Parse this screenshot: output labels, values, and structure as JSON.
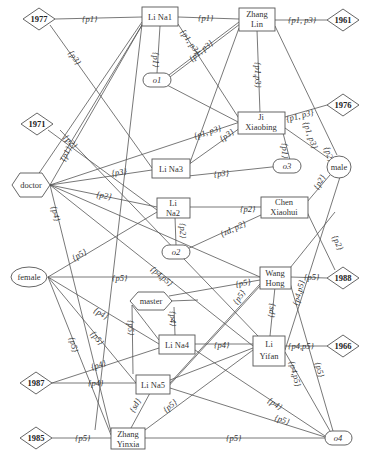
{
  "nodes": {
    "person": [
      {
        "id": "linal",
        "lines": [
          "Li Na1"
        ],
        "x": 142,
        "y": 7,
        "w": 36,
        "h": 19
      },
      {
        "id": "zhanglin",
        "lines": [
          "Zhang",
          "Lin"
        ],
        "x": 239,
        "y": 10,
        "w": 36,
        "h": 20
      },
      {
        "id": "jixiaobing",
        "lines": [
          "Ji",
          "Xiaobing"
        ],
        "x": 240,
        "y": 113,
        "w": 45,
        "h": 20
      },
      {
        "id": "lina3",
        "lines": [
          "Li Na3"
        ],
        "x": 152,
        "y": 159,
        "w": 36,
        "h": 19
      },
      {
        "id": "lina2",
        "lines": [
          "Li",
          "Na2"
        ],
        "x": 157,
        "y": 198,
        "w": 33,
        "h": 19
      },
      {
        "id": "chenxiaohui",
        "lines": [
          "Chen",
          "Xiaohui"
        ],
        "x": 261,
        "y": 197,
        "w": 46,
        "h": 20
      },
      {
        "id": "wanghong",
        "lines": [
          "Wang",
          "Hong"
        ],
        "x": 260,
        "y": 267,
        "w": 30,
        "h": 20
      },
      {
        "id": "lina4",
        "lines": [
          "Li Na4"
        ],
        "x": 159,
        "y": 335,
        "w": 36,
        "h": 19
      },
      {
        "id": "liyifan",
        "lines": [
          "Li",
          "Yifan"
        ],
        "x": 253,
        "y": 336,
        "w": 32,
        "h": 30
      },
      {
        "id": "lina5",
        "lines": [
          "Li Na5"
        ],
        "x": 136,
        "y": 374,
        "w": 34,
        "h": 19
      },
      {
        "id": "zhangyinxia",
        "lines": [
          "Zhang",
          "Yinxia"
        ],
        "x": 111,
        "y": 428,
        "w": 34,
        "h": 20
      }
    ],
    "year": [
      {
        "id": "y1977",
        "label": "1977",
        "cx": 39,
        "cy": 19
      },
      {
        "id": "y1961",
        "label": "1961",
        "cx": 343,
        "cy": 20
      },
      {
        "id": "y1976",
        "label": "1976",
        "cx": 343,
        "cy": 105
      },
      {
        "id": "y1971",
        "label": "1971",
        "cx": 37,
        "cy": 124
      },
      {
        "id": "y1988",
        "label": "1988",
        "cx": 343,
        "cy": 278
      },
      {
        "id": "y1966",
        "label": "1966",
        "cx": 343,
        "cy": 346
      },
      {
        "id": "y1987",
        "label": "1987",
        "cx": 36,
        "cy": 383
      },
      {
        "id": "y1985",
        "label": "1985",
        "cx": 36,
        "cy": 438
      }
    ],
    "attribute_hex": [
      {
        "id": "doctor",
        "label": "doctor",
        "cx": 31,
        "cy": 185
      },
      {
        "id": "master",
        "label": "master",
        "cx": 151,
        "cy": 301
      }
    ],
    "attribute_ellipse": [
      {
        "id": "male",
        "label": "male",
        "cx": 337,
        "cy": 166
      },
      {
        "id": "female",
        "label": "female",
        "cx": 28,
        "cy": 277
      }
    ],
    "object": [
      {
        "id": "o1",
        "label": "o1",
        "cx": 157,
        "cy": 80
      },
      {
        "id": "o2",
        "label": "o2",
        "cx": 176,
        "cy": 252
      },
      {
        "id": "o3",
        "label": "o3",
        "cx": 290,
        "cy": 166
      },
      {
        "id": "o4",
        "label": "o4",
        "cx": 338,
        "cy": 438
      }
    ]
  },
  "edges": [
    {
      "from": "y1977",
      "to": "linal",
      "label": "{p1}"
    },
    {
      "from": "linal",
      "to": "zhanglin",
      "label": "{p1}"
    },
    {
      "from": "zhanglin",
      "to": "y1961",
      "label": "{p1, p3}"
    },
    {
      "from": "linal",
      "to": "o1",
      "label": "{p1}"
    },
    {
      "from": "y1977",
      "to": "lina3",
      "label": "{p3}"
    },
    {
      "from": "linal",
      "to": "jixiaobing",
      "label": "{p1, p3}"
    },
    {
      "from": "o1",
      "to": "zhanglin",
      "label": "{p1, p3}"
    },
    {
      "from": "zhanglin",
      "to": "jixiaobing",
      "label": "{p1,p3}"
    },
    {
      "from": "zhanglin",
      "to": "male",
      "label": "{p1, p3}"
    },
    {
      "from": "jixiaobing",
      "to": "y1976",
      "label": "{p1, p3}"
    },
    {
      "from": "jixiaobing",
      "to": "o3",
      "label": "{p1}"
    },
    {
      "from": "jixiaobing",
      "to": "male",
      "label": "{p2}"
    },
    {
      "from": "doctor",
      "to": "jixiaobing",
      "label": "{p1, p3}"
    },
    {
      "from": "lina3",
      "to": "jixiaobing",
      "label": "{p3}"
    },
    {
      "from": "lina3",
      "to": "o3",
      "label": "{p3}"
    },
    {
      "from": "y1971",
      "to": "lina2",
      "label": "{p2}"
    },
    {
      "from": "doctor",
      "to": "linal",
      "label": "{p1}"
    },
    {
      "from": "doctor",
      "to": "lina3",
      "label": "{p3}"
    },
    {
      "from": "doctor",
      "to": "lina2",
      "label": "{p2}"
    },
    {
      "from": "doctor",
      "to": "zhangyinxia",
      "label": "{p4}"
    },
    {
      "from": "lina2",
      "to": "chenxiaohui",
      "label": "{p2}"
    },
    {
      "from": "lina2",
      "to": "o2",
      "label": "{p2}"
    },
    {
      "from": "o2",
      "to": "chenxiaohui",
      "label": "{zd, p2}"
    },
    {
      "from": "chenxiaohui",
      "to": "male",
      "label": "{p2}"
    },
    {
      "from": "chenxiaohui",
      "to": "y1988",
      "label": "{p2}"
    },
    {
      "from": "female",
      "to": "lina2",
      "label": "{p5}"
    },
    {
      "from": "female",
      "to": "wanghong",
      "label": "{p5}"
    },
    {
      "from": "female",
      "to": "lina4",
      "label": "{p4}"
    },
    {
      "from": "female",
      "to": "lina5",
      "label": "{p5}"
    },
    {
      "from": "female",
      "to": "zhangyinxia",
      "label": "{p5}"
    },
    {
      "from": "doctor",
      "to": "liyifan",
      "label": "{p4,p5}"
    },
    {
      "from": "master",
      "to": "wanghong",
      "label": "{p5}"
    },
    {
      "from": "master",
      "to": "lina4",
      "label": "{p4}"
    },
    {
      "from": "master",
      "to": "lina5",
      "label": "{p5}"
    },
    {
      "from": "wanghong",
      "to": "y1988",
      "label": "{p5}"
    },
    {
      "from": "wanghong",
      "to": "liyifan",
      "label": "{sd}"
    },
    {
      "from": "wanghong",
      "to": "lina5",
      "label": "{p5}"
    },
    {
      "from": "male",
      "to": "liyifan",
      "label": "{p4,p5}"
    },
    {
      "from": "lina4",
      "to": "liyifan",
      "label": "{p4}"
    },
    {
      "from": "liyifan",
      "to": "y1966",
      "label": "{p4,p5}"
    },
    {
      "from": "liyifan",
      "to": "o4",
      "label": "{p4,p5}"
    },
    {
      "from": "wanghong",
      "to": "o4",
      "label": "{p5}"
    },
    {
      "from": "y1987",
      "to": "lina4",
      "label": "{p4}"
    },
    {
      "from": "y1987",
      "to": "lina5",
      "label": "{p4}"
    },
    {
      "from": "lina5",
      "to": "zhangyinxia",
      "label": "{sd}"
    },
    {
      "from": "zhangyinxia",
      "to": "liyifan",
      "label": "{p5}"
    },
    {
      "from": "lina4",
      "to": "o4",
      "label": "{p4}"
    },
    {
      "from": "lina5",
      "to": "o4",
      "label": "{p5}"
    },
    {
      "from": "y1985",
      "to": "zhangyinxia",
      "label": "{p5}"
    },
    {
      "from": "zhangyinxia",
      "to": "o4",
      "label": "{p5}"
    }
  ]
}
